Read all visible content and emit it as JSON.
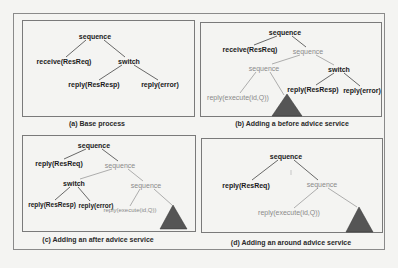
{
  "colors": {
    "base_node": "#1a1a1a",
    "advice_node": "#8a8a8a",
    "triangle": "#555555",
    "edge_base": "#444444",
    "edge_advice": "#9a9a9a"
  },
  "panels": [
    {
      "id": "a",
      "caption": "(a) Base process",
      "nodes": {
        "root": "sequence",
        "receive": "receive(ResReq)",
        "switch": "switch",
        "reply_resp": "reply(ResResp)",
        "reply_error": "reply(error)"
      }
    },
    {
      "id": "b",
      "caption": "(b) Adding a before advice service",
      "nodes": {
        "root": "sequence",
        "receive": "receive(ResReq)",
        "advice_seq": "sequence",
        "inner_seq": "sequence",
        "switch": "switch",
        "advice_reply": "reply(execute(id,Q))",
        "reply_resp": "reply(ResResp)",
        "reply_error": "reply(error)"
      }
    },
    {
      "id": "c",
      "caption": "(c) Adding an after advice service",
      "nodes": {
        "root": "sequence",
        "reply_req": "reply(ResReq)",
        "advice_seq": "sequence",
        "switch": "switch",
        "inner_seq": "sequence",
        "reply_resp": "reply(ResResp)",
        "reply_error": "reply(error)",
        "advice_reply": "reply(execute(id,Q))"
      }
    },
    {
      "id": "d",
      "caption": "(d) Adding an around advice service",
      "nodes": {
        "root": "sequence",
        "reply_req": "reply(ResReq)",
        "advice_seq": "sequence",
        "advice_reply": "reply(execute(id,Q))"
      }
    }
  ]
}
